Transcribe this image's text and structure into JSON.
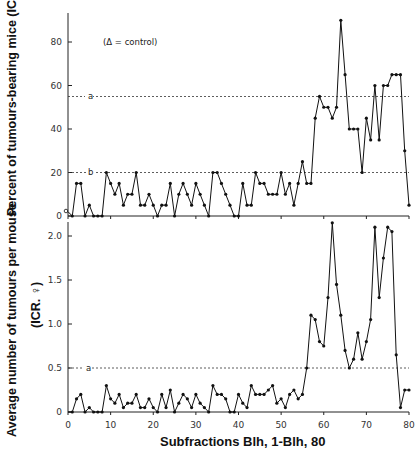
{
  "chart_data": [
    {
      "type": "line",
      "title": "",
      "xlabel": "Subfractions Blh, 1-Blh, 80",
      "ylabel": "Percent of tumours-bearing mice (ICR. ♀)",
      "xlim": [
        0,
        80
      ],
      "ylim": [
        0,
        95
      ],
      "x_ticks": [
        0,
        10,
        20,
        30,
        40,
        50,
        60,
        70,
        80
      ],
      "y_ticks": [
        "0",
        "20",
        "40",
        "60",
        "80"
      ],
      "annotation": "(Δ = control)",
      "reference_lines": [
        {
          "label": "a",
          "value": 55
        },
        {
          "label": "b",
          "value": 20
        }
      ],
      "control_point": {
        "x": 0,
        "y": 2
      },
      "x": [
        1,
        2,
        3,
        4,
        5,
        6,
        7,
        8,
        9,
        10,
        11,
        12,
        13,
        14,
        15,
        16,
        17,
        18,
        19,
        20,
        21,
        22,
        23,
        24,
        25,
        26,
        27,
        28,
        29,
        30,
        31,
        32,
        33,
        34,
        35,
        36,
        37,
        38,
        39,
        40,
        41,
        42,
        43,
        44,
        45,
        46,
        47,
        48,
        49,
        50,
        51,
        52,
        53,
        54,
        55,
        56,
        57,
        58,
        59,
        60,
        61,
        62,
        63,
        64,
        65,
        66,
        67,
        68,
        69,
        70,
        71,
        72,
        73,
        74,
        75,
        76,
        77,
        78,
        79,
        80
      ],
      "values": [
        0,
        15,
        15,
        0,
        5,
        0,
        0,
        0,
        20,
        15,
        10,
        15,
        5,
        10,
        10,
        20,
        5,
        5,
        10,
        5,
        0,
        5,
        5,
        15,
        0,
        10,
        15,
        10,
        5,
        15,
        10,
        5,
        0,
        20,
        20,
        15,
        10,
        5,
        0,
        0,
        15,
        5,
        5,
        20,
        15,
        15,
        10,
        10,
        10,
        20,
        10,
        15,
        5,
        15,
        25,
        15,
        15,
        45,
        55,
        50,
        50,
        45,
        50,
        90,
        65,
        40,
        40,
        40,
        20,
        45,
        35,
        60,
        35,
        60,
        60,
        65,
        65,
        65,
        30,
        5
      ]
    },
    {
      "type": "line",
      "title": "",
      "xlabel": "Subfractions Blh, 1-Blh, 80",
      "ylabel": "Average number of tumours per mouse (ICR. ♀)",
      "xlim": [
        0,
        80
      ],
      "ylim": [
        0,
        2.2
      ],
      "x_ticks": [
        0,
        10,
        20,
        30,
        40,
        50,
        60,
        70,
        80
      ],
      "y_ticks": [
        "0",
        "0.5",
        "1.0",
        "1.5",
        "2.0"
      ],
      "reference_lines": [
        {
          "label": "a",
          "value": 0.5
        }
      ],
      "control_point": {
        "x": 0,
        "y": 0
      },
      "x": [
        1,
        2,
        3,
        4,
        5,
        6,
        7,
        8,
        9,
        10,
        11,
        12,
        13,
        14,
        15,
        16,
        17,
        18,
        19,
        20,
        21,
        22,
        23,
        24,
        25,
        26,
        27,
        28,
        29,
        30,
        31,
        32,
        33,
        34,
        35,
        36,
        37,
        38,
        39,
        40,
        41,
        42,
        43,
        44,
        45,
        46,
        47,
        48,
        49,
        50,
        51,
        52,
        53,
        54,
        55,
        56,
        57,
        58,
        59,
        60,
        61,
        62,
        63,
        64,
        65,
        66,
        67,
        68,
        69,
        70,
        71,
        72,
        73,
        74,
        75,
        76,
        77,
        78,
        79,
        80
      ],
      "values": [
        0,
        0.15,
        0.2,
        0,
        0.05,
        0,
        0,
        0,
        0.3,
        0.15,
        0.1,
        0.2,
        0.05,
        0.1,
        0.1,
        0.2,
        0.05,
        0.05,
        0.15,
        0.05,
        0,
        0.2,
        0.05,
        0.25,
        0,
        0.1,
        0.2,
        0.15,
        0.05,
        0.2,
        0.1,
        0.05,
        0,
        0.3,
        0.2,
        0.2,
        0.15,
        0,
        0,
        0.2,
        0.1,
        0.05,
        0.3,
        0.2,
        0.2,
        0.2,
        0.25,
        0.3,
        0.1,
        0.15,
        0.05,
        0.2,
        0.25,
        0.15,
        0.2,
        0.5,
        1.1,
        1.05,
        0.8,
        0.75,
        1.3,
        2.15,
        1.45,
        1.1,
        0.7,
        0.5,
        0.6,
        0.9,
        0.6,
        0.8,
        1.05,
        2.1,
        1.3,
        1.75,
        2.1,
        2.05,
        0.65,
        0.05,
        0.25,
        0.25
      ]
    }
  ],
  "labels": {
    "top_ylabel": "Percent of tumours-bearing mice (ICR. ♀)",
    "bottom_ylabel_line1": "Average number of tumours per mouse",
    "bottom_ylabel_line2": "(ICR. ♀)",
    "xlabel": "Subfractions Blh, 1-Blh, 80",
    "annotation": "(Δ = control)",
    "ref_a_top": "a",
    "ref_b_top": "b",
    "ref_a_bottom": "a",
    "top_ticks": [
      "0",
      "20",
      "40",
      "60",
      "80"
    ],
    "bottom_ticks": [
      "0",
      "0.5",
      "1.0",
      "1.5",
      "2.0"
    ],
    "x_ticks": [
      "0",
      "10",
      "20",
      "30",
      "40",
      "50",
      "60",
      "70",
      "80"
    ]
  }
}
